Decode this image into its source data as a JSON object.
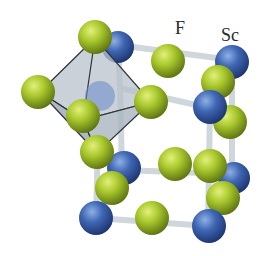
{
  "labels": {
    "fluorine": "F",
    "scandium": "Sc"
  },
  "colors": {
    "fluorine": "#a8c72c",
    "scandium": "#3f66b3",
    "bond": "#d7dde2",
    "octahedron": "#a9b4be",
    "background": "#ffffff"
  },
  "structure": {
    "name": "ScF3 crystal structure",
    "unit": "cubic cell with corner-sharing ScF6 octahedron"
  }
}
